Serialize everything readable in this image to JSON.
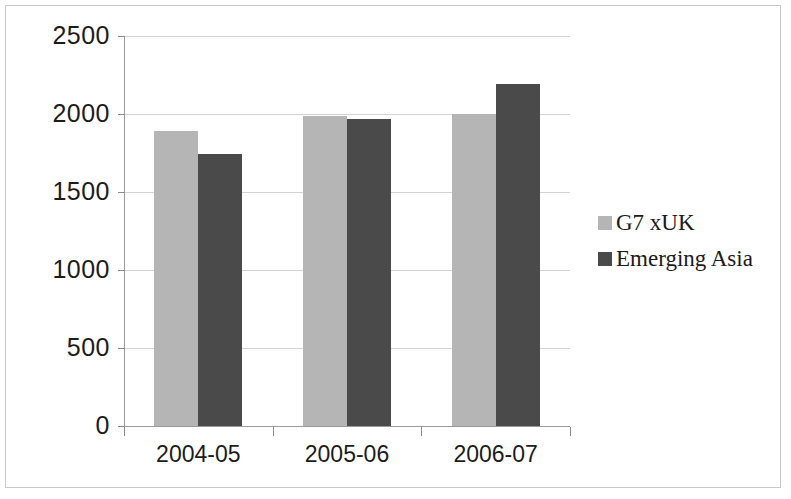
{
  "chart_data": {
    "type": "bar",
    "title": "",
    "subtitle": "",
    "xlabel": "",
    "ylabel": "",
    "categories": [
      "2004-05",
      "2005-06",
      "2006-07"
    ],
    "series": [
      {
        "name": "G7 xUK",
        "color": "#b5b5b5",
        "values": [
          1890,
          1985,
          2000
        ]
      },
      {
        "name": "Emerging Asia",
        "color": "#4a4a4a",
        "values": [
          1745,
          1965,
          2190
        ]
      }
    ],
    "ylim": [
      0,
      2500
    ],
    "ytick_labels": [
      "2500",
      "2000",
      "1500",
      "1000",
      "500",
      "0"
    ],
    "ytick_values": [
      2500,
      2000,
      1500,
      1000,
      500,
      0
    ],
    "grid": true,
    "grid_axis": "y",
    "legend_position": "right"
  },
  "legend": {
    "items": [
      {
        "label": "G7 xUK",
        "swatch": "light"
      },
      {
        "label": "Emerging Asia",
        "swatch": "dark"
      }
    ]
  },
  "colors": {
    "series_light": "#b5b5b5",
    "series_dark": "#4a4a4a",
    "gridline": "#d3d3d3",
    "axis": "#9a9a9a",
    "text": "#1c1c1c",
    "frame_border": "#c9c9c9",
    "background": "#ffffff"
  }
}
